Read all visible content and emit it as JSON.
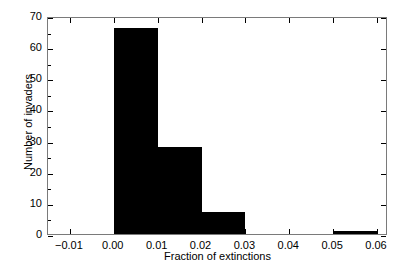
{
  "chart_data": {
    "type": "bar",
    "title": "",
    "subtitle": "",
    "xlabel": "Fraction of extinctions",
    "ylabel": "Number of invaders",
    "categories": [
      "0.00-0.01",
      "0.01-0.02",
      "0.02-0.03",
      "0.03-0.04",
      "0.04-0.05",
      "0.05-0.06"
    ],
    "bin_edges": [
      0.0,
      0.01,
      0.02,
      0.03,
      0.04,
      0.05,
      0.06
    ],
    "values": [
      66,
      28,
      7,
      0,
      0,
      1
    ],
    "bin_width": 0.01,
    "xlim": [
      -0.015,
      0.0625
    ],
    "ylim": [
      0,
      70
    ],
    "xticks": [
      -0.01,
      0.0,
      0.01,
      0.02,
      0.03,
      0.04,
      0.05,
      0.06
    ],
    "xtick_labels": [
      "−0.01",
      "0.00",
      "0.01",
      "0.02",
      "0.03",
      "0.04",
      "0.05",
      "0.06"
    ],
    "yticks": [
      0,
      10,
      20,
      30,
      40,
      50,
      60,
      70
    ],
    "ytick_labels": [
      "0",
      "10",
      "20",
      "30",
      "40",
      "50",
      "60",
      "70"
    ],
    "grid": false,
    "legend": null,
    "legend_position": "none",
    "bar_color": "#000000",
    "frame_color": "#7a7a7a",
    "background": "#ffffff",
    "annotations": []
  }
}
